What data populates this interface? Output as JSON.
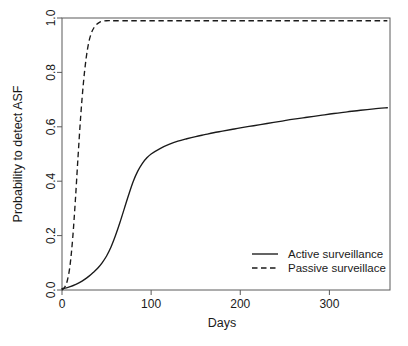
{
  "chart_data": {
    "type": "line",
    "title": "",
    "subtitle": "",
    "xlabel": "Days",
    "ylabel": "Probability to detect ASF",
    "xlim": [
      0,
      368
    ],
    "ylim": [
      0,
      1.0
    ],
    "grid": false,
    "legend_position": "bottom-right",
    "x_ticks": [
      0,
      100,
      200,
      300
    ],
    "x_tick_labels": [
      "0",
      "100",
      "200",
      "300"
    ],
    "y_ticks": [
      0.0,
      0.2,
      0.4,
      0.6,
      0.8,
      1.0
    ],
    "y_tick_labels": [
      "0.0",
      "0.2",
      "0.4",
      "0.6",
      "0.8",
      "1.0"
    ],
    "series": [
      {
        "name": "Active surveillance",
        "style": "solid",
        "color": "#1a1a1a",
        "x": [
          0,
          5,
          10,
          15,
          20,
          25,
          30,
          35,
          40,
          45,
          50,
          55,
          60,
          65,
          70,
          75,
          80,
          85,
          90,
          95,
          100,
          110,
          120,
          130,
          140,
          150,
          160,
          170,
          180,
          190,
          200,
          215,
          230,
          245,
          260,
          275,
          290,
          305,
          320,
          335,
          350,
          365
        ],
        "values": [
          0.005,
          0.008,
          0.013,
          0.02,
          0.028,
          0.038,
          0.05,
          0.064,
          0.08,
          0.1,
          0.125,
          0.158,
          0.2,
          0.248,
          0.3,
          0.352,
          0.4,
          0.437,
          0.465,
          0.485,
          0.5,
          0.52,
          0.535,
          0.547,
          0.556,
          0.564,
          0.571,
          0.578,
          0.584,
          0.59,
          0.596,
          0.604,
          0.612,
          0.62,
          0.628,
          0.635,
          0.642,
          0.649,
          0.655,
          0.661,
          0.666,
          0.67
        ]
      },
      {
        "name": "Passive surveillace",
        "style": "dashed",
        "color": "#1a1a1a",
        "x": [
          0,
          3,
          6,
          9,
          12,
          15,
          18,
          21,
          24,
          27,
          30,
          33,
          36,
          39,
          42,
          45,
          50,
          60,
          80,
          120,
          180,
          240,
          300,
          365
        ],
        "values": [
          0.0,
          0.01,
          0.035,
          0.09,
          0.19,
          0.33,
          0.49,
          0.64,
          0.76,
          0.85,
          0.91,
          0.945,
          0.965,
          0.977,
          0.984,
          0.988,
          0.99,
          0.99,
          0.99,
          0.99,
          0.99,
          0.99,
          0.99,
          0.99
        ]
      }
    ]
  },
  "legend": {
    "entries": [
      {
        "label": "Active surveillance",
        "style": "solid"
      },
      {
        "label": "Passive surveillace",
        "style": "dashed"
      }
    ]
  }
}
